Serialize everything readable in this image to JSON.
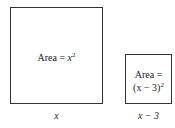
{
  "diagram": {
    "big_square": {
      "area_prefix": "Area = ",
      "area_var": "x",
      "area_exp": "2",
      "side_label": "x"
    },
    "small_square": {
      "area_line1": "Area =",
      "area_line2_expr": "(x − 3)",
      "area_exp": "2",
      "side_label": "x − 3"
    }
  }
}
